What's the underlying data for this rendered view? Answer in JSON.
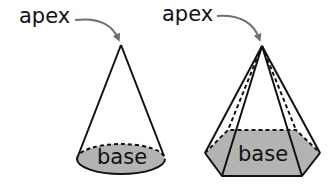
{
  "colors": {
    "background": "#ffffff",
    "outline": "#111111",
    "base_fill": "#b3b3b3",
    "arrow": "#6e6e6e"
  },
  "figures": [
    {
      "shape": "cone",
      "apex_label": "apex",
      "base_label": "base"
    },
    {
      "shape": "hexagonal pyramid",
      "apex_label": "apex",
      "base_label": "base"
    }
  ]
}
